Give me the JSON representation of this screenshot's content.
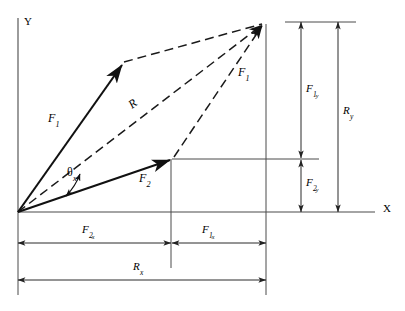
{
  "figure": {
    "background_color": "#ffffff",
    "stroke_color": "#1a1a1a",
    "thin_stroke_color": "#555555"
  },
  "axes": {
    "y_label": "Y",
    "x_label": "X",
    "origin": {
      "x": 18,
      "y": 212
    },
    "y_axis_top": {
      "x": 18,
      "y": 18
    },
    "x_axis_right": {
      "x": 375,
      "y": 212
    }
  },
  "vectors": [
    {
      "name": "F1",
      "label_main": "F",
      "label_sub": "1",
      "style": "solid",
      "from": {
        "x": 18,
        "y": 212
      },
      "to": {
        "x": 124,
        "y": 62
      },
      "label_pos": {
        "x": 48,
        "y": 112
      }
    },
    {
      "name": "F2",
      "label_main": "F",
      "label_sub": "2",
      "style": "solid",
      "from": {
        "x": 18,
        "y": 212
      },
      "to": {
        "x": 172,
        "y": 159
      },
      "label_pos": {
        "x": 139,
        "y": 173
      }
    },
    {
      "name": "R",
      "label_main": "R",
      "label_sub": "",
      "style": "dashed",
      "from": {
        "x": 18,
        "y": 212
      },
      "to": {
        "x": 265,
        "y": 22
      },
      "label_pos": {
        "x": 126,
        "y": 103
      }
    },
    {
      "name": "F1-translated",
      "label_main": "F",
      "label_sub": "1",
      "style": "dashed",
      "from": {
        "x": 172,
        "y": 159
      },
      "to": {
        "x": 265,
        "y": 22
      },
      "label_pos": {
        "x": 238,
        "y": 67
      }
    }
  ],
  "parallelogram": {
    "side_f2_translated": {
      "from": {
        "x": 124,
        "y": 62
      },
      "to": {
        "x": 265,
        "y": 22
      }
    },
    "style": "dashed"
  },
  "angle": {
    "label_main": "θ",
    "label_sub": "x",
    "label_pos": {
      "x": 67,
      "y": 168
    },
    "arc_center": {
      "x": 18,
      "y": 212
    },
    "arc_radius": 62
  },
  "dimensions": {
    "horizontal": [
      {
        "name": "F2x",
        "label_main": "F",
        "label_sub": "2",
        "label_sub2": "x",
        "from_x": 18,
        "to_x": 171,
        "y": 243,
        "label_pos": {
          "x": 82,
          "y": 226
        }
      },
      {
        "name": "F1x",
        "label_main": "F",
        "label_sub": "1",
        "label_sub2": "x",
        "from_x": 171,
        "to_x": 266,
        "y": 243,
        "label_pos": {
          "x": 202,
          "y": 226
        }
      },
      {
        "name": "Rx",
        "label_main": "R",
        "label_sub": "x",
        "label_sub2": "",
        "from_x": 18,
        "to_x": 266,
        "y": 280,
        "label_pos": {
          "x": 133,
          "y": 263
        }
      }
    ],
    "vertical": [
      {
        "name": "F1y",
        "label_main": "F",
        "label_sub": "1",
        "label_sub2": "y",
        "x": 301,
        "from_y": 22,
        "to_y": 159,
        "label_pos": {
          "x": 307,
          "y": 84
        }
      },
      {
        "name": "F2y",
        "label_main": "F",
        "label_sub": "2",
        "label_sub2": "y",
        "x": 301,
        "from_y": 159,
        "to_y": 212,
        "label_pos": {
          "x": 307,
          "y": 179
        }
      },
      {
        "name": "Ry",
        "label_main": "R",
        "label_sub": "y",
        "label_sub2": "",
        "x": 338,
        "from_y": 22,
        "to_y": 212,
        "label_pos": {
          "x": 344,
          "y": 107
        }
      }
    ],
    "extension_lines": [
      {
        "name": "top-extension",
        "x1": 285,
        "y1": 22,
        "x2": 356,
        "y2": 22
      },
      {
        "name": "mid-extension",
        "x1": 172,
        "y1": 159,
        "x2": 319,
        "y2": 159
      },
      {
        "name": "tip-vertical-extension",
        "x1": 266,
        "y1": 22,
        "x2": 266,
        "y2": 295
      },
      {
        "name": "f2x-vertical-extension",
        "x1": 171,
        "y1": 159,
        "x2": 171,
        "y2": 268
      },
      {
        "name": "origin-vertical-extension",
        "x1": 18,
        "y1": 212,
        "x2": 18,
        "y2": 295
      }
    ]
  }
}
